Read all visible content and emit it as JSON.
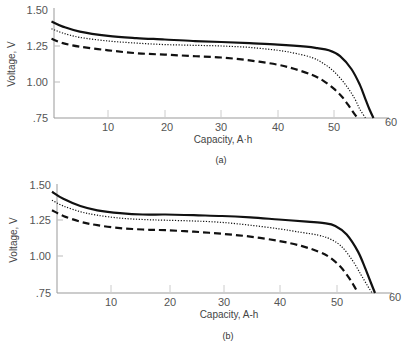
{
  "chart_data": [
    {
      "type": "line",
      "panel_label": "(a)",
      "xlabel": "Capacity, A·h",
      "ylabel": "Voltage, V",
      "xlim": [
        0,
        60
      ],
      "ylim": [
        0.75,
        1.5
      ],
      "x_ticks": [
        10,
        20,
        30,
        40,
        50,
        60
      ],
      "x_tick_labels": [
        "10",
        "20",
        "30",
        "40",
        "50",
        "60"
      ],
      "y_ticks": [
        0.75,
        1.0,
        1.25,
        1.5
      ],
      "y_tick_labels": [
        ".75",
        "1.00",
        "1.25",
        "1.50"
      ],
      "grid": false,
      "legend": "none",
      "series": [
        {
          "name": "solid",
          "style": "solid",
          "x": [
            0,
            2,
            5,
            10,
            15,
            20,
            25,
            30,
            35,
            40,
            45,
            47,
            49,
            51,
            53,
            54.5,
            55.5,
            56.3,
            56.9
          ],
          "y": [
            1.42,
            1.385,
            1.35,
            1.32,
            1.305,
            1.295,
            1.285,
            1.278,
            1.27,
            1.26,
            1.245,
            1.235,
            1.22,
            1.18,
            1.09,
            0.98,
            0.88,
            0.8,
            0.75
          ]
        },
        {
          "name": "dotted",
          "style": "dotted",
          "x": [
            0,
            2,
            5,
            10,
            15,
            20,
            25,
            30,
            35,
            40,
            43,
            46,
            48,
            50,
            52,
            53.5,
            54.5,
            55.5
          ],
          "y": [
            1.37,
            1.34,
            1.31,
            1.285,
            1.27,
            1.26,
            1.255,
            1.25,
            1.24,
            1.22,
            1.2,
            1.17,
            1.13,
            1.07,
            0.98,
            0.89,
            0.81,
            0.75
          ]
        },
        {
          "name": "dashed",
          "style": "dashed",
          "x": [
            0,
            2,
            5,
            10,
            15,
            20,
            25,
            30,
            35,
            40,
            43,
            46,
            48,
            50,
            51.5,
            52.8,
            53.5,
            54.1
          ],
          "y": [
            1.3,
            1.27,
            1.245,
            1.22,
            1.2,
            1.19,
            1.18,
            1.17,
            1.15,
            1.12,
            1.09,
            1.05,
            1.01,
            0.95,
            0.89,
            0.82,
            0.78,
            0.75
          ]
        }
      ]
    },
    {
      "type": "line",
      "panel_label": "(b)",
      "xlabel": "Capacity, A-h",
      "ylabel": "Voltage, V",
      "xlim": [
        0,
        60
      ],
      "ylim": [
        0.75,
        1.5
      ],
      "x_ticks": [
        10,
        20,
        30,
        40,
        50,
        60
      ],
      "x_tick_labels": [
        "10",
        "20",
        "30",
        "40",
        "50",
        "60"
      ],
      "y_ticks": [
        0.75,
        1.0,
        1.25,
        1.5
      ],
      "y_tick_labels": [
        ".75",
        "1.00",
        "1.25",
        "1.50"
      ],
      "grid": false,
      "legend": "none",
      "series": [
        {
          "name": "solid",
          "style": "solid",
          "x": [
            0,
            2,
            5,
            8,
            12,
            16,
            20,
            25,
            30,
            35,
            40,
            45,
            48,
            50,
            52,
            54,
            55.3,
            56.3,
            57
          ],
          "y": [
            1.46,
            1.41,
            1.36,
            1.33,
            1.31,
            1.3,
            1.3,
            1.295,
            1.29,
            1.28,
            1.265,
            1.25,
            1.24,
            1.22,
            1.16,
            1.04,
            0.92,
            0.82,
            0.75
          ]
        },
        {
          "name": "dotted",
          "style": "dotted",
          "x": [
            0,
            2,
            5,
            8,
            12,
            16,
            20,
            25,
            30,
            35,
            40,
            44,
            47,
            49,
            51,
            53,
            54.5,
            55.7,
            56.5
          ],
          "y": [
            1.4,
            1.36,
            1.32,
            1.295,
            1.275,
            1.265,
            1.26,
            1.255,
            1.245,
            1.225,
            1.2,
            1.175,
            1.155,
            1.13,
            1.08,
            0.98,
            0.88,
            0.8,
            0.75
          ]
        },
        {
          "name": "dashed",
          "style": "dashed",
          "x": [
            0,
            2,
            5,
            8,
            12,
            16,
            20,
            25,
            30,
            35,
            40,
            44,
            47,
            49,
            51,
            52.5,
            53.3,
            54
          ],
          "y": [
            1.33,
            1.29,
            1.25,
            1.225,
            1.205,
            1.195,
            1.19,
            1.18,
            1.165,
            1.145,
            1.115,
            1.08,
            1.04,
            1.0,
            0.93,
            0.85,
            0.8,
            0.75
          ]
        }
      ]
    }
  ]
}
